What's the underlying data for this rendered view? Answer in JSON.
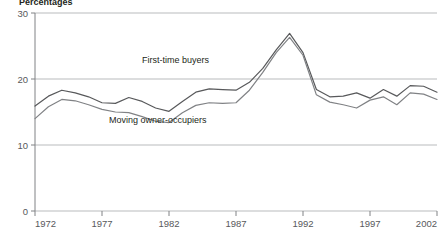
{
  "chart_data": {
    "type": "line",
    "title": "",
    "ylabel": "Percentages",
    "xlabel": "",
    "ylim": [
      0,
      30
    ],
    "yticks": [
      0,
      10,
      20,
      30
    ],
    "xlim": [
      1972,
      2002
    ],
    "xticks": [
      1972,
      1977,
      1982,
      1987,
      1992,
      1997,
      2002
    ],
    "xtick_labels": [
      "1972",
      "1977",
      "1982",
      "1987",
      "1992",
      "1997",
      "2002"
    ],
    "ytick_labels": [
      "0",
      "10",
      "20",
      "30"
    ],
    "grid": true,
    "grid_axis": "y",
    "legend_position": "inline-annotation",
    "x": [
      1972,
      1973,
      1974,
      1975,
      1976,
      1977,
      1978,
      1979,
      1980,
      1981,
      1982,
      1983,
      1984,
      1985,
      1986,
      1987,
      1988,
      1989,
      1990,
      1991,
      1992,
      1993,
      1994,
      1995,
      1996,
      1997,
      1998,
      1999,
      2000,
      2001,
      2002
    ],
    "series": [
      {
        "name": "First-time buyers",
        "color": "#58595b",
        "values": [
          15.9,
          17.4,
          18.3,
          17.9,
          17.3,
          16.4,
          16.3,
          17.2,
          16.6,
          15.6,
          15.1,
          16.6,
          18.0,
          18.5,
          18.4,
          18.3,
          19.5,
          21.6,
          24.4,
          26.9,
          24.0,
          18.4,
          17.3,
          17.4,
          17.9,
          17.1,
          18.4,
          17.4,
          19.0,
          18.9,
          18.0
        ]
      },
      {
        "name": "Moving owner-occupiers",
        "color": "#808285",
        "values": [
          14.0,
          15.8,
          16.9,
          16.7,
          16.1,
          15.4,
          15.0,
          14.9,
          14.3,
          13.6,
          13.4,
          14.9,
          16.0,
          16.4,
          16.3,
          16.4,
          18.3,
          21.0,
          24.0,
          26.3,
          23.6,
          17.6,
          16.5,
          16.1,
          15.6,
          16.8,
          17.3,
          16.1,
          17.9,
          17.7,
          16.9
        ]
      }
    ],
    "annotations": [
      {
        "name": "first-time-buyers-label",
        "text": "First-time buyers",
        "x_px": 142,
        "y_px": 63
      },
      {
        "name": "moving-owner-occupiers-label",
        "text": "Moving owner-occupiers",
        "x_px": 109,
        "y_px": 123
      }
    ]
  }
}
